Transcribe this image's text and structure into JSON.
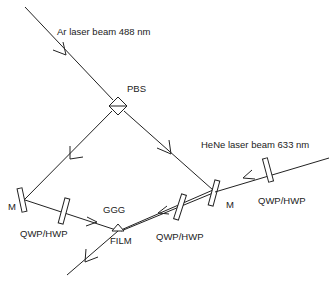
{
  "diagram": {
    "labels": {
      "ar_beam": "Ar laser beam 488 nm",
      "pbs": "PBS",
      "hene_beam": "HeNe laser beam 633 nm",
      "left_mirror": "M",
      "right_mirror": "M",
      "left_plate": "QWP/HWP",
      "middle_plate": "QWP/HWP",
      "right_plate": "QWP/HWP",
      "ggg": "GGG",
      "film": "FILM"
    },
    "colors": {
      "line": "#222222",
      "background": "#ffffff"
    }
  }
}
